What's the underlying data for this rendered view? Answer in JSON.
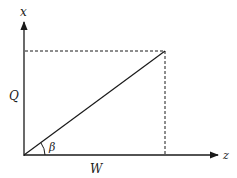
{
  "diagram": {
    "axes": {
      "vertical_label": "x",
      "horizontal_label": "z"
    },
    "labels": {
      "vertical_component": "Q",
      "horizontal_component": "W",
      "angle": "β"
    },
    "colors": {
      "stroke": "#1a1a1a",
      "background": "#ffffff"
    }
  }
}
